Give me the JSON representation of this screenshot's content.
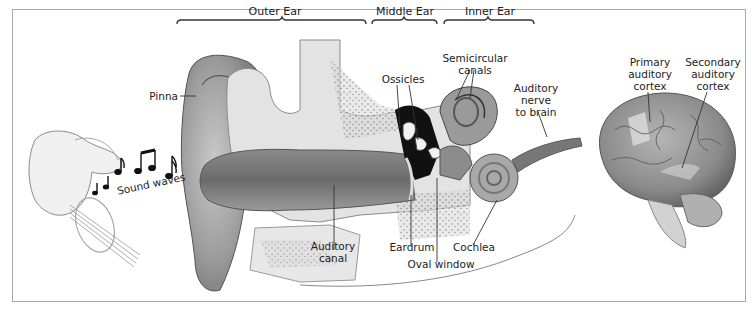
{
  "figure": {
    "sections": [
      {
        "id": "outer",
        "label": "Outer Ear"
      },
      {
        "id": "middle",
        "label": "Middle Ear"
      },
      {
        "id": "inner",
        "label": "Inner Ear"
      }
    ],
    "labels": {
      "pinna": "Pinna",
      "sound_waves": "Sound waves",
      "ossicles": "Ossicles",
      "semicircular_1": "Semicircular",
      "semicircular_2": "canals",
      "nerve_1": "Auditory",
      "nerve_2": "nerve",
      "nerve_3": "to brain",
      "canal_1": "Auditory",
      "canal_2": "canal",
      "eardrum": "Eardrum",
      "oval_window": "Oval window",
      "cochlea": "Cochlea",
      "primary_1": "Primary",
      "primary_2": "auditory",
      "primary_3": "cortex",
      "secondary_1": "Secondary",
      "secondary_2": "auditory",
      "secondary_3": "cortex"
    },
    "colors": {
      "frame": "#a8a8a8",
      "ink": "#222222",
      "skin": "#9a9a9a",
      "dark": "#1a1a1a"
    }
  }
}
